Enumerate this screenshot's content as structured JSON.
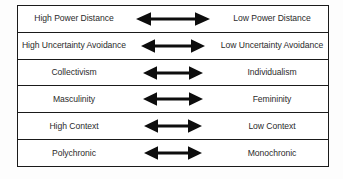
{
  "diagram": {
    "arrow_icon_name": "double-headed-arrow-icon",
    "colors": {
      "border": "#1a1a1a",
      "text": "#2b2b2b",
      "arrow": "#0d0d0d",
      "background": "#ffffff"
    },
    "rows": [
      {
        "left": "High Power Distance",
        "right": "Low Power Distance",
        "arrow_width": 74
      },
      {
        "left": "High Uncertainty Avoidance",
        "right": "Low Uncertainty Avoidance",
        "arrow_width": 64
      },
      {
        "left": "Collectivism",
        "right": "Individualism",
        "arrow_width": 60
      },
      {
        "left": "Masculinity",
        "right": "Femininity",
        "arrow_width": 60
      },
      {
        "left": "High Context",
        "right": "Low Context",
        "arrow_width": 58
      },
      {
        "left": "Polychronic",
        "right": "Monochronic",
        "arrow_width": 58
      }
    ]
  }
}
